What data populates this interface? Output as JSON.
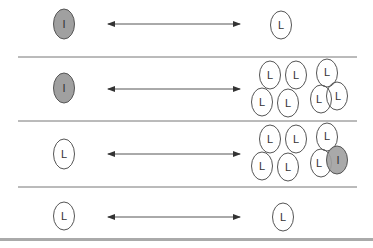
{
  "diagram": {
    "type": "binding-equilibrium-panels",
    "colors": {
      "inhibitor_fill": "#a0a0a0",
      "ligand_fill": "#ffffff",
      "stroke": "#555555",
      "divider": "#777777",
      "bottom_band": "#aaaaaa"
    },
    "rows": [
      {
        "left": {
          "label": "I",
          "kind": "inhibitor"
        },
        "arrow": "double-headed",
        "right": [
          {
            "label": "L",
            "kind": "ligand"
          }
        ]
      },
      {
        "left": {
          "label": "I",
          "kind": "inhibitor"
        },
        "arrow": "double-headed",
        "right": [
          {
            "label": "L",
            "kind": "ligand"
          },
          {
            "label": "L",
            "kind": "ligand"
          },
          {
            "label": "L",
            "kind": "ligand"
          },
          {
            "label": "L",
            "kind": "ligand"
          },
          {
            "label": "L",
            "kind": "ligand"
          },
          {
            "label": "L",
            "kind": "ligand"
          },
          {
            "label": "L",
            "kind": "ligand"
          }
        ]
      },
      {
        "left": {
          "label": "L",
          "kind": "ligand"
        },
        "arrow": "double-headed",
        "right": [
          {
            "label": "L",
            "kind": "ligand"
          },
          {
            "label": "L",
            "kind": "ligand"
          },
          {
            "label": "L",
            "kind": "ligand"
          },
          {
            "label": "L",
            "kind": "ligand"
          },
          {
            "label": "L",
            "kind": "ligand"
          },
          {
            "label": "L",
            "kind": "ligand"
          },
          {
            "label": "I",
            "kind": "inhibitor"
          }
        ]
      },
      {
        "left": {
          "label": "L",
          "kind": "ligand"
        },
        "arrow": "double-headed",
        "right": [
          {
            "label": "L",
            "kind": "ligand"
          }
        ]
      }
    ]
  }
}
